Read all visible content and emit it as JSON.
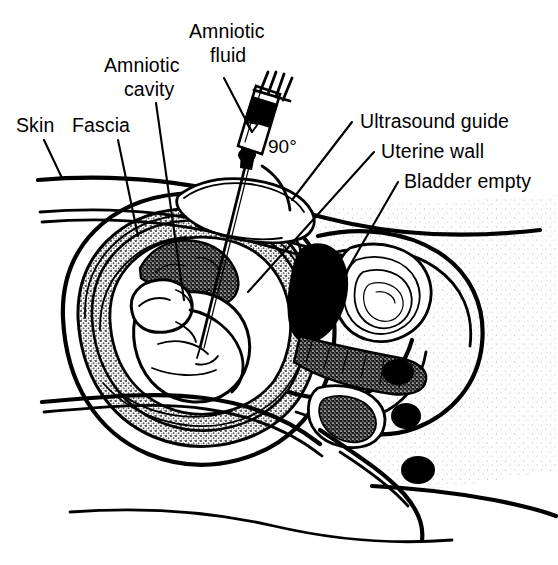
{
  "figure": {
    "width": 558,
    "height": 565,
    "background_color": "#ffffff",
    "ink_color": "#000000",
    "tones": {
      "myometrium_stipple": "#b4b4b4",
      "placenta_dark_stipple": "#5a5a5a",
      "fat_light_stipple": "#dcdcdc",
      "sacrum_mid": "#6e6e6e",
      "solid_black": "#000000"
    }
  },
  "labels": {
    "skin": "Skin",
    "fascia": "Fascia",
    "amniotic_cavity_line1": "Amniotic",
    "amniotic_cavity_line2": "cavity",
    "amniotic_fluid_line1": "Amniotic",
    "amniotic_fluid_line2": "fluid",
    "angle": "90°",
    "ultrasound_guide": "Ultrasound guide",
    "uterine_wall": "Uterine wall",
    "bladder_empty": "Bladder empty"
  },
  "annotations": {
    "needle_angle_degrees": 90,
    "label_count": 7
  }
}
